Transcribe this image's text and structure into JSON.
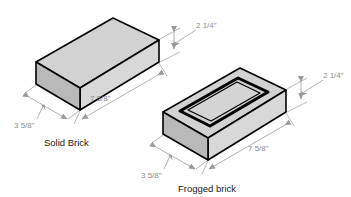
{
  "figure": {
    "background_color": "#ffffff",
    "line_color": "#000000",
    "dimension_color": "#8d8d8d",
    "face_colors": {
      "top": "#d2d2d2",
      "front": "#d8d8d8",
      "side": "#b9b9b9"
    }
  },
  "bricks": [
    {
      "id": "solid-brick",
      "caption": "Solid Brick",
      "dimensions": [
        {
          "id": "height",
          "label": "2 1/4\"",
          "value": "2 1/4",
          "unit": "inch"
        },
        {
          "id": "length",
          "label": "7 5/8\"",
          "value": "7 5/8",
          "unit": "inch"
        },
        {
          "id": "width",
          "label": "3 5/8\"",
          "value": "3 5/8",
          "unit": "inch"
        }
      ]
    },
    {
      "id": "frogged-brick",
      "caption": "Frogged brick",
      "dimensions": [
        {
          "id": "height",
          "label": "2 1/4\"",
          "value": "2 1/4",
          "unit": "inch"
        },
        {
          "id": "length",
          "label": "7 5/8\"",
          "value": "7 5/8",
          "unit": "inch"
        },
        {
          "id": "width",
          "label": "3 5/8\"",
          "value": "3 5/8",
          "unit": "inch"
        }
      ]
    }
  ]
}
